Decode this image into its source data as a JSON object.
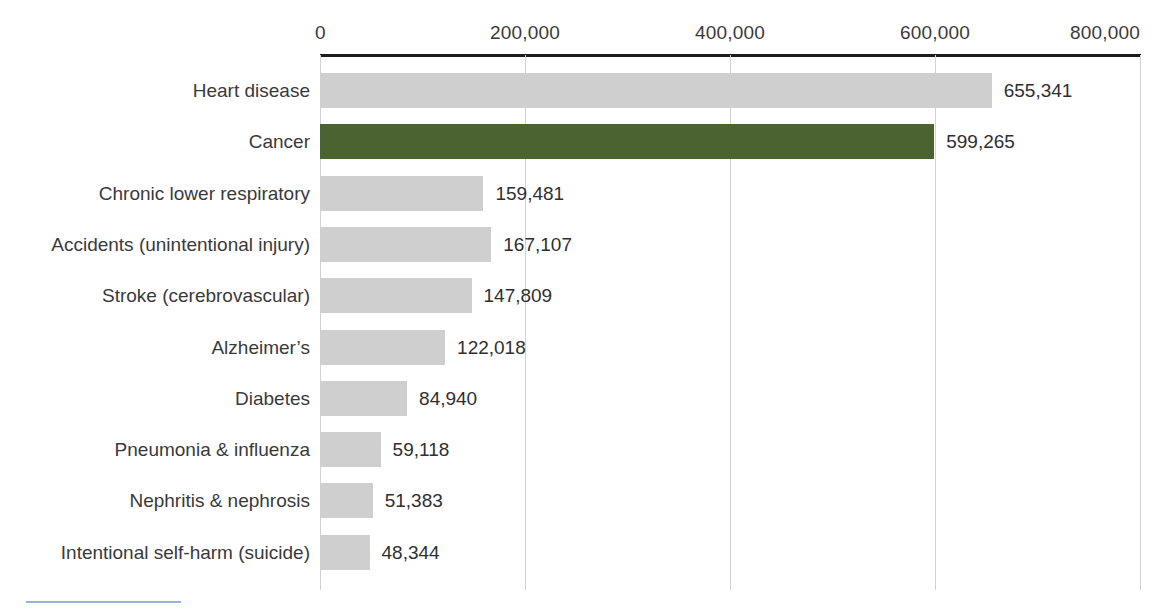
{
  "chart_data": {
    "type": "bar",
    "orientation": "horizontal",
    "title": "",
    "xlabel": "",
    "ylabel": "",
    "xlim": [
      0,
      800000
    ],
    "grid": true,
    "legend": "none",
    "axis_ticks": [
      "0",
      "200,000",
      "400,000",
      "600,000",
      "800,000"
    ],
    "axis_tick_values": [
      0,
      200000,
      400000,
      600000,
      800000
    ],
    "categories": [
      "Heart disease",
      "Cancer",
      "Chronic lower respiratory",
      "Accidents (unintentional injury)",
      "Stroke (cerebrovascular)",
      "Alzheimer’s",
      "Diabetes",
      "Pneumonia & influenza",
      "Nephritis & nephrosis",
      "Intentional self-harm (suicide)"
    ],
    "values": [
      655341,
      599265,
      159481,
      167107,
      147809,
      122018,
      84940,
      59118,
      51383,
      48344
    ],
    "value_labels": [
      "655,341",
      "599,265",
      "159,481",
      "167,107",
      "147,809",
      "122,018",
      "84,940",
      "59,118",
      "51,383",
      "48,344"
    ],
    "highlight_index": 1,
    "colors": {
      "bar": "#cfcfcf",
      "highlight": "#4b6330",
      "axis": "#1d1d1d",
      "gridline": "#d2d2d2",
      "text": "#3a3a3a",
      "bottom_rule": "#7fa9cf"
    }
  }
}
